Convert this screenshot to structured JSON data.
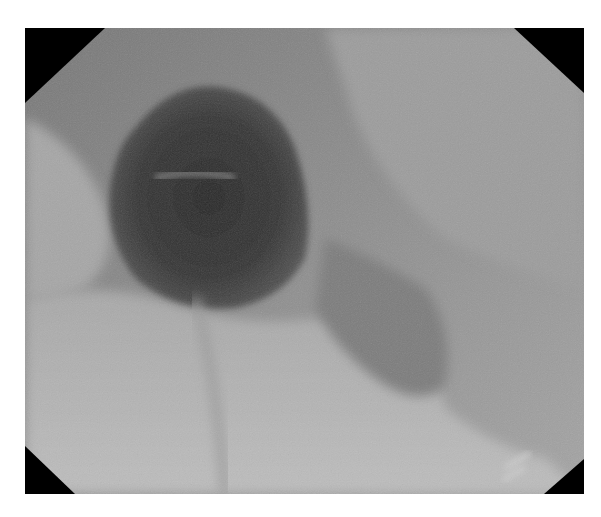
{
  "image": {
    "description": "Grayscale endoscopic image of a lumen with octagonal black corner masks",
    "colors": {
      "background": "#ffffff",
      "mask": "#000000",
      "mucosa_light": "#b4b4b4",
      "mucosa_mid": "#8c8c8c",
      "lumen_dark": "#2e2e2e"
    }
  }
}
